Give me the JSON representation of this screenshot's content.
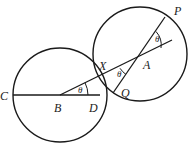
{
  "diagram": {
    "points": {
      "C": "C",
      "B": "B",
      "D": "D",
      "X": "X",
      "A": "A",
      "Q": "Q",
      "P": "P"
    },
    "angle_label": "θ",
    "angles": [
      {
        "name": "angle-DBX",
        "label": "θ"
      },
      {
        "name": "angle-XAQ",
        "label": "θ"
      },
      {
        "name": "angle-PA-extension",
        "label": "θ"
      }
    ],
    "colors": {
      "stroke": "#1a1a1a",
      "background": "#ffffff"
    }
  }
}
